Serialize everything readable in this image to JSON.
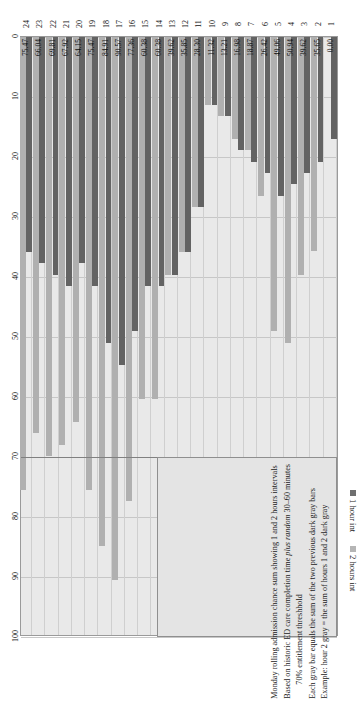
{
  "chart_data": {
    "type": "bar",
    "orientation": "horizontal",
    "title": "",
    "xlabel": "",
    "ylabel": "",
    "xlim": [
      0,
      100
    ],
    "xticks": [
      0,
      10,
      20,
      30,
      40,
      50,
      60,
      70,
      80,
      90,
      100
    ],
    "grid": true,
    "legend_position": "top-right",
    "categories": [
      "1",
      "2",
      "3",
      "4",
      "5",
      "6",
      "7",
      "8",
      "9",
      "10",
      "11",
      "12",
      "13",
      "14",
      "15",
      "16",
      "17",
      "18",
      "19",
      "20",
      "21",
      "22",
      "23",
      "24"
    ],
    "series": [
      {
        "name": "1 hour int",
        "color": "#636363",
        "values": [
          16.98,
          20.75,
          22.64,
          24.53,
          26.42,
          22.64,
          20.75,
          18.87,
          13.21,
          11.32,
          28.3,
          35.85,
          39.62,
          41.51,
          41.51,
          49.06,
          54.72,
          50.94,
          41.51,
          37.74,
          41.51,
          39.62,
          37.74,
          35.85
        ]
      },
      {
        "name": "2 hours int",
        "color": "#b0b0b0",
        "values": [
          0.0,
          35.65,
          39.62,
          50.94,
          49.06,
          26.42,
          18.87,
          16.98,
          13.21,
          11.32,
          28.3,
          35.85,
          39.62,
          60.38,
          60.38,
          77.36,
          90.57,
          84.91,
          75.47,
          64.15,
          67.92,
          69.81,
          66.04,
          75.47
        ]
      }
    ],
    "data_labels": [
      "0.00",
      "35.65",
      "39.62",
      "50.94",
      "49.06",
      "26.42",
      "18.87",
      "16.98",
      "13.21",
      "11.32",
      "28.30",
      "35.85",
      "39.62",
      "60.38",
      "60.38",
      "77.36",
      "90.57",
      "84.91",
      "75.47",
      "64.15",
      "67.92",
      "69.81",
      "66.04",
      "75.47"
    ],
    "threshold": {
      "value": 70,
      "label": "70% entitlement threshhold",
      "color": "#808080"
    },
    "annotation": {
      "lines": [
        "Monday rolling admission chance sum showing 1 and 2 hours intervals",
        "Based on historic ED care completion time plus random 30–60 minutes",
        "70% entitlement threshhold",
        "Each gray bar equals the sum of the two previous dark gray bars",
        "Example: hour 2 gray = the sum of hours 1 and 2 dark gray"
      ],
      "line2_plain_a": "Based on historic ED care completion time ",
      "line2_italic": "plus random",
      "line2_plain_b": " 30–60 minutes",
      "line3_indented": "70% entitlement threshhold"
    }
  },
  "legend": {
    "items": [
      {
        "label": "1 hour int",
        "swatch": "dark-square-icon"
      },
      {
        "label": "2 hours int",
        "swatch": "light-square-icon"
      }
    ]
  },
  "colors": {
    "plot_background": "#e9e9e9",
    "grid": "#c7c7c7",
    "series_1": "#636363",
    "series_2": "#b0b0b0",
    "threshold": "#808080",
    "annotation_background": "#e4e4e4"
  }
}
